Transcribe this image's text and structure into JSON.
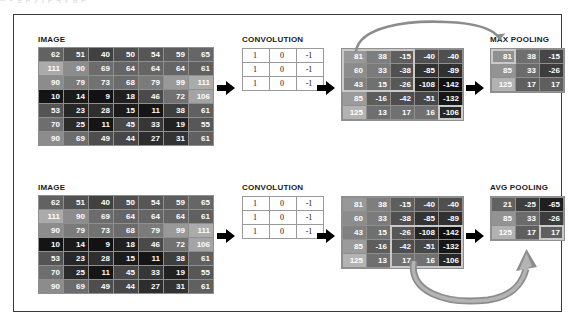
{
  "top_clip_text": "a  e  g  p  y     j  p     q  y     g     p",
  "sections": [
    {
      "id": "max",
      "image_label": "IMAGE",
      "conv_label": "CONVOLUTION",
      "pool_label": "MAX POOLING",
      "image_matrix": [
        [
          62,
          51,
          40,
          50,
          54,
          59,
          65
        ],
        [
          111,
          90,
          69,
          64,
          64,
          64,
          61
        ],
        [
          90,
          79,
          73,
          68,
          79,
          99,
          111
        ],
        [
          10,
          14,
          9,
          18,
          46,
          72,
          106
        ],
        [
          53,
          23,
          28,
          15,
          11,
          38,
          61
        ],
        [
          70,
          25,
          11,
          45,
          33,
          19,
          55
        ],
        [
          90,
          69,
          49,
          44,
          27,
          31,
          61
        ]
      ],
      "kernel": [
        [
          1,
          0,
          -1
        ],
        [
          1,
          0,
          -1
        ],
        [
          1,
          0,
          -1
        ]
      ],
      "feature_map": [
        [
          81,
          38,
          -15,
          -40,
          -40
        ],
        [
          60,
          33,
          -38,
          -85,
          -89
        ],
        [
          43,
          15,
          -26,
          -108,
          -142
        ],
        [
          85,
          -16,
          -42,
          -51,
          -132
        ],
        [
          125,
          13,
          17,
          16,
          -106
        ]
      ],
      "pooled": [
        [
          81,
          38,
          -15
        ],
        [
          85,
          33,
          -26
        ],
        [
          125,
          17,
          17
        ]
      ],
      "highlight_fmap": {
        "row": 0,
        "col": 0,
        "size": 3
      },
      "highlight_pool": {
        "row": 0,
        "col": 0
      },
      "extra_highlight_fmap_cell": {
        "row": 4,
        "col": 4
      }
    },
    {
      "id": "avg",
      "image_label": "IMAGE",
      "conv_label": "CONVOLUTION",
      "pool_label": "AVG POOLING",
      "image_matrix": [
        [
          62,
          51,
          40,
          50,
          54,
          59,
          65
        ],
        [
          111,
          90,
          69,
          64,
          64,
          64,
          61
        ],
        [
          90,
          79,
          73,
          68,
          79,
          99,
          111
        ],
        [
          10,
          14,
          9,
          18,
          46,
          72,
          106
        ],
        [
          53,
          23,
          28,
          15,
          11,
          38,
          61
        ],
        [
          70,
          25,
          11,
          45,
          33,
          19,
          55
        ],
        [
          90,
          69,
          49,
          44,
          27,
          31,
          61
        ]
      ],
      "kernel": [
        [
          1,
          0,
          -1
        ],
        [
          1,
          0,
          -1
        ],
        [
          1,
          0,
          -1
        ]
      ],
      "feature_map": [
        [
          81,
          38,
          -15,
          -40,
          -40
        ],
        [
          60,
          33,
          -38,
          -85,
          -89
        ],
        [
          43,
          15,
          -26,
          -108,
          -142
        ],
        [
          85,
          -16,
          -42,
          -51,
          -132
        ],
        [
          125,
          13,
          17,
          16,
          -106
        ]
      ],
      "pooled": [
        [
          21,
          -25,
          -65
        ],
        [
          85,
          33,
          -26
        ],
        [
          125,
          17,
          17
        ]
      ],
      "highlight_fmap": {
        "row": 2,
        "col": 2,
        "size": 3
      },
      "highlight_pool": {
        "row": 2,
        "col": 2
      },
      "extra_highlight_fmap_cell": null
    }
  ],
  "colors": {
    "frame": "#3a3a3a",
    "grid_bg": "#8f8f8f",
    "highlight": "#c9c9c9",
    "arrow_black": "#000000",
    "arrow_gray": "#8c8c8c",
    "cell_text": "#ffffff"
  }
}
